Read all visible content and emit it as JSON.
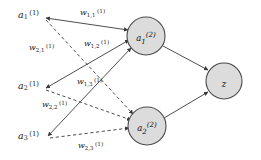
{
  "diagram": {
    "type": "neural-network-graph",
    "title": "",
    "colors": {
      "node_fill": "#dcdcdc",
      "node_stroke": "#4a4a4a",
      "edge": "#3a3a3a",
      "background": "#ffffff",
      "text": "#1a1a1a"
    },
    "input_layer": {
      "nodes": [
        {
          "id": "a1-1",
          "base": "a",
          "sub": "1",
          "sup": "(1)",
          "x": 30,
          "y": 15
        },
        {
          "id": "a2-1",
          "base": "a",
          "sub": "2",
          "sup": "(1)",
          "x": 30,
          "y": 86
        },
        {
          "id": "a3-1",
          "base": "a",
          "sub": "3",
          "sup": "(1)",
          "x": 30,
          "y": 136
        }
      ]
    },
    "hidden_layer": {
      "nodes": [
        {
          "id": "a1-2",
          "base": "a",
          "sub": "1",
          "sup": "(2)",
          "cx": 146,
          "cy": 36,
          "r": 19
        },
        {
          "id": "a2-2",
          "base": "a",
          "sub": "2",
          "sup": "(2)",
          "cx": 147,
          "cy": 126,
          "r": 19
        }
      ]
    },
    "output_layer": {
      "nodes": [
        {
          "id": "z",
          "base": "z",
          "sub": "",
          "sup": "",
          "cx": 224,
          "cy": 81,
          "r": 18
        }
      ]
    },
    "weights": [
      {
        "id": "w11",
        "base": "w",
        "sub": "1,1",
        "sup": "(1)",
        "from": "a1-1",
        "to": "a1-2",
        "style": "solid",
        "x": 80,
        "y": 9
      },
      {
        "id": "w12",
        "base": "w",
        "sub": "1,2",
        "sup": "(1)",
        "from": "a2-1",
        "to": "a1-2",
        "style": "solid",
        "x": 84,
        "y": 40
      },
      {
        "id": "w13",
        "base": "w",
        "sub": "1,3",
        "sup": "(1)",
        "from": "a3-1",
        "to": "a1-2",
        "style": "solid",
        "x": 77,
        "y": 78
      },
      {
        "id": "w21",
        "base": "w",
        "sub": "2,1",
        "sup": "(1)",
        "from": "a1-1",
        "to": "a2-2",
        "style": "dashed",
        "x": 29,
        "y": 44
      },
      {
        "id": "w22",
        "base": "w",
        "sub": "2,2",
        "sup": "(1)",
        "from": "a2-1",
        "to": "a2-2",
        "style": "dashed",
        "x": 42,
        "y": 101
      },
      {
        "id": "w23",
        "base": "w",
        "sub": "2,3",
        "sup": "(1)",
        "from": "a3-1",
        "to": "a2-2",
        "style": "dashed",
        "x": 78,
        "y": 142
      }
    ],
    "output_edges": [
      {
        "id": "e-h1-z",
        "from": "a1-2",
        "to": "z",
        "style": "solid"
      },
      {
        "id": "e-h2-z",
        "from": "a2-2",
        "to": "z",
        "style": "solid"
      }
    ]
  }
}
